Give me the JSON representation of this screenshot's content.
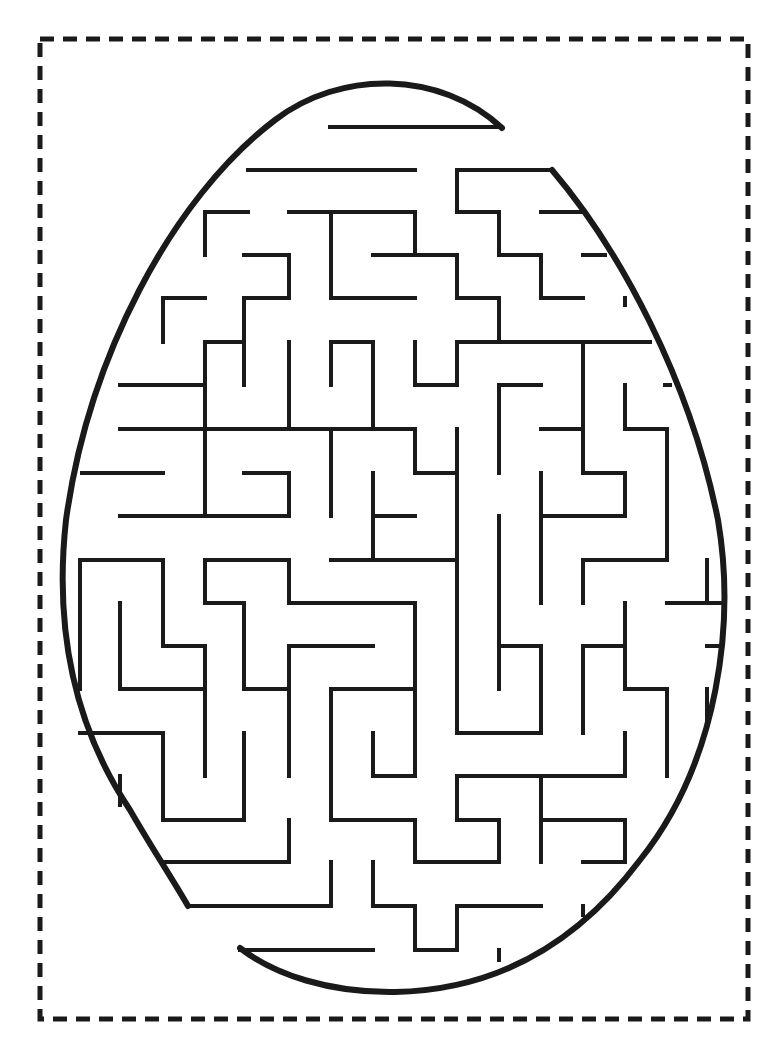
{
  "page": {
    "width": 769,
    "height": 1058,
    "background": "#ffffff"
  },
  "colors": {
    "ink": "#1a1a1a",
    "background": "#ffffff"
  },
  "cut_border": {
    "x": 40,
    "y": 39,
    "width": 708,
    "height": 980,
    "stroke_width": 5,
    "dash": "14 9"
  },
  "egg_outline": {
    "stroke_width": 6,
    "segments": [
      "M 502 128 C 440 70 340 70 275 120 C 170 200 88 360 66 520 C 55 620 70 720 130 810 C 150 845 170 875 188 906",
      "M 552 170 C 620 250 690 380 718 520 C 735 620 720 760 640 860 C 580 940 500 990 395 992 C 330 993 275 975 240 948"
    ]
  },
  "maze": {
    "stroke_width": 4,
    "walls": [
      "M 330 127 L 500 127",
      "M 248 170 L 415 170",
      "M 457 170 L 552 170",
      "M 457 170 L 457 212 L 499 212 L 499 255 L 541 255 L 541 298 L 583 298",
      "M 205 212 L 248 212",
      "M 205 212 L 205 255",
      "M 289 212 L 415 212 L 415 255",
      "M 331 212 L 331 298 L 415 298",
      "M 541 212 L 583 212",
      "M 244 255 L 289 255 L 289 298 L 244 298 L 244 385",
      "M 373 255 L 457 255 L 457 298 L 499 298 L 499 342",
      "M 583 255 L 605 255",
      "M 163 298 L 205 298",
      "M 163 298 L 163 342",
      "M 625 298 L 625 305",
      "M 205 342 L 244 342",
      "M 205 342 L 205 516",
      "M 289 342 L 289 429",
      "M 331 342 L 331 385",
      "M 331 342 L 373 342 L 373 429",
      "M 415 342 L 415 385 L 457 385 L 457 342 L 650 342",
      "M 583 342 L 583 473",
      "M 120 385 L 205 385",
      "M 499 385 L 541 385",
      "M 499 385 L 499 473",
      "M 625 385 L 625 429 L 667 429 L 667 560",
      "M 665 385 L 670 385",
      "M 120 429 L 415 429",
      "M 415 429 L 415 473 L 457 473",
      "M 541 429 L 583 429",
      "M 457 429 L 457 729",
      "M 331 429 L 331 516",
      "M 583 473 L 625 473 L 625 516 L 541 516",
      "M 82 473 L 163 473",
      "M 244 473 L 289 473 L 289 516 L 120 516",
      "M 373 473 L 373 560",
      "M 373 516 L 415 516",
      "M 499 516 L 499 689",
      "M 541 473 L 541 603",
      "M 80 560 L 163 560 L 163 646 L 205 646 L 205 776",
      "M 205 560 L 289 560 L 289 603 L 415 603 L 415 776 L 373 776 L 373 733",
      "M 331 560 L 457 560",
      "M 583 560 L 667 560",
      "M 583 560 L 583 603",
      "M 205 560 L 205 603 L 244 603 L 244 689 L 289 689",
      "M 80 560 L 80 689",
      "M 120 603 L 120 689 L 205 689",
      "M 625 603 L 625 689 L 667 689 L 667 776",
      "M 667 603 L 720 603",
      "M 707 560 L 707 603",
      "M 289 646 L 373 646",
      "M 289 646 L 289 776",
      "M 499 646 L 541 646 L 541 733 L 457 733",
      "M 583 646 L 625 646",
      "M 583 646 L 583 733",
      "M 707 646 L 720 646",
      "M 707 689 L 707 720",
      "M 331 689 L 415 689",
      "M 331 689 L 331 820 L 415 820 L 415 862 L 499 862 L 499 820 L 457 820 L 457 776 L 541 776 L 541 862",
      "M 80 733 L 163 733 L 163 820 L 244 820 L 244 733",
      "M 120 776 L 120 805",
      "M 625 733 L 625 776 L 457 776",
      "M 541 820 L 625 820 L 625 862",
      "M 583 862 L 625 862",
      "M 289 820 L 289 862 L 163 862",
      "M 188 906 L 331 906 L 331 862",
      "M 373 862 L 373 906 L 415 906 L 415 950 L 457 950 L 457 906 L 541 906",
      "M 583 906 L 583 915",
      "M 240 950 L 373 950",
      "M 499 950 L 499 960"
    ]
  }
}
